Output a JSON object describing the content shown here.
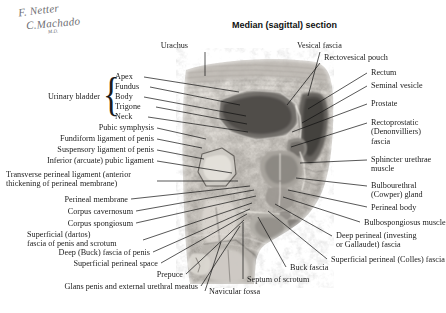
{
  "figure": {
    "title": "Median (sagittal) section",
    "signature_line1": "F. Netter",
    "signature_line2": "C.Machado",
    "signature_credential": "M.D.",
    "plate_type": "grayscale sagittal anatomic cryosection of the male pelvis",
    "background_color": "#ffffff",
    "label_color": "#1c1c1c",
    "leader_color": "#101010"
  },
  "groups": {
    "urinary_bladder": {
      "label": "Urinary bladder",
      "brace_glyph": "{",
      "parts": [
        "Apex",
        "Fundus",
        "Body",
        "Trigone",
        "Neck"
      ]
    }
  },
  "labels_top": [
    {
      "id": "urachus",
      "text": "Urachus"
    },
    {
      "id": "vesical-fascia",
      "text": "Vesical fascia"
    },
    {
      "id": "rectovesical-pouch",
      "text": "Rectovesical pouch"
    }
  ],
  "labels_left": [
    {
      "id": "apex",
      "text": "Apex"
    },
    {
      "id": "fundus",
      "text": "Fundus"
    },
    {
      "id": "body",
      "text": "Body"
    },
    {
      "id": "trigone",
      "text": "Trigone"
    },
    {
      "id": "neck",
      "text": "Neck"
    },
    {
      "id": "urinary-bladder",
      "text": "Urinary bladder"
    },
    {
      "id": "pubic-symphysis",
      "text": "Pubic symphysis"
    },
    {
      "id": "fundiform-ligament",
      "text": "Fundiform ligament of penis"
    },
    {
      "id": "suspensory-ligament",
      "text": "Suspensory ligament of penis"
    },
    {
      "id": "inferior-arcuate-pubic-ligament",
      "text": "Inferior (arcuate) pubic ligament"
    },
    {
      "id": "transverse-perineal-ligament",
      "text": "Transverse perineal ligament (anterior\nthickening of perineal membrane)"
    },
    {
      "id": "perineal-membrane",
      "text": "Perineal membrane"
    },
    {
      "id": "corpus-cavernosum",
      "text": "Corpus cavernosum"
    },
    {
      "id": "corpus-spongiosum",
      "text": "Corpus spongiosum"
    },
    {
      "id": "superficial-dartos-fascia",
      "text": "Superficial (dartos)\nfascia of penis and scrotum"
    },
    {
      "id": "deep-buck-fascia",
      "text": "Deep (Buck) fascia of penis"
    },
    {
      "id": "superficial-perineal-space",
      "text": "Superficial perineal space"
    },
    {
      "id": "prepuce",
      "text": "Prepuce"
    },
    {
      "id": "glans-penis",
      "text": "Glans penis and external urethral meatus"
    }
  ],
  "labels_right": [
    {
      "id": "rectum",
      "text": "Rectum"
    },
    {
      "id": "seminal-vesicle",
      "text": "Seminal vesicle"
    },
    {
      "id": "prostate",
      "text": "Prostate"
    },
    {
      "id": "rectoprostatic-fascia",
      "text": "Rectoprostatic\n(Denonvilliers)\nfascia"
    },
    {
      "id": "sphincter-urethrae-muscle",
      "text": "Sphincter urethrae\nmuscle"
    },
    {
      "id": "bulbourethral-gland",
      "text": "Bulbourethral\n(Cowper) gland"
    },
    {
      "id": "perineal-body",
      "text": "Perineal body"
    },
    {
      "id": "bulbospongiosus-muscle",
      "text": "Bulbospongiosus muscle"
    },
    {
      "id": "deep-perineal-fascia",
      "text": "Deep perineal (investing\nor Gallaudet) fascia"
    },
    {
      "id": "superficial-perineal-colles-fascia",
      "text": "Superficial perineal (Colles) fascia"
    }
  ],
  "labels_bottom": [
    {
      "id": "buck-fascia-bottom",
      "text": "Buck fascia"
    },
    {
      "id": "septum-of-scrotum",
      "text": "Septum of scrotum"
    },
    {
      "id": "navicular-fossa",
      "text": "Navicular fossa"
    }
  ]
}
